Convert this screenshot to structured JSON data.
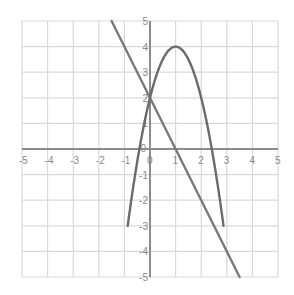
{
  "chart_data": {
    "type": "line",
    "title": "",
    "xlabel": "",
    "ylabel": "",
    "xlim": [
      -5,
      5
    ],
    "ylim": [
      -5,
      5
    ],
    "grid": true,
    "x_ticks": [
      "-5",
      "-4",
      "-3",
      "-2",
      "-1",
      "0",
      "1",
      "2",
      "3",
      "4",
      "5"
    ],
    "y_ticks": [
      "5",
      "4",
      "3",
      "2",
      "1",
      "0",
      "-1",
      "-2",
      "-3",
      "-4",
      "-5"
    ],
    "series": [
      {
        "name": "parabola",
        "equation": "y = -2x^2 + 4x + 2",
        "x": [
          -1.0,
          -0.5,
          0,
          0.5,
          1,
          1.5,
          2,
          2.5,
          3,
          3.09
        ],
        "y": [
          -4.0,
          -0.5,
          2,
          3.5,
          4,
          3.5,
          2,
          -0.5,
          -4,
          -4.6
        ],
        "color": "#6b6b6b"
      },
      {
        "name": "line",
        "equation": "y = -2x + 2",
        "x": [
          -1.5,
          3.5
        ],
        "y": [
          5,
          -5
        ],
        "color": "#7a7a7a"
      }
    ],
    "intersections": [
      [
        0,
        2
      ],
      [
        3,
        -4
      ]
    ],
    "vertex": [
      1,
      4
    ]
  },
  "colors": {
    "grid": "#d9d9d9",
    "axis": "#8c8c8c",
    "curve": "#6b6b6b",
    "background": "#ffffff"
  }
}
